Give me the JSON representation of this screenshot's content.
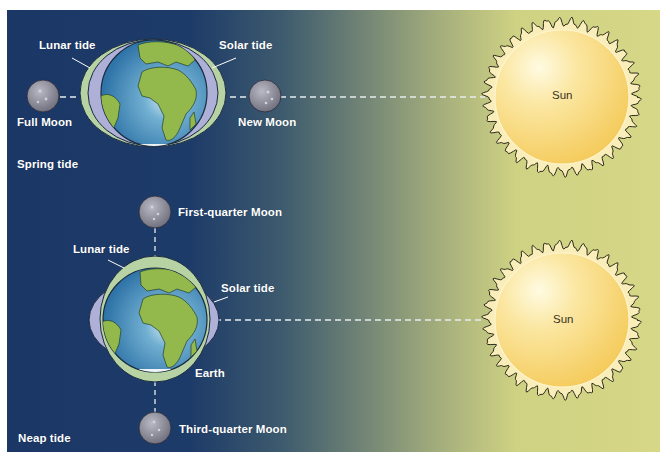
{
  "diagram": {
    "colors": {
      "background_left": "#1b3766",
      "background_right": "#d6d787",
      "lunar_tide_bulge": "#b7d3a3",
      "solar_tide_bulge": "#aeb0d8",
      "ocean": "#3e86b8",
      "land": "#93b84c",
      "moon": "#8d8c99",
      "sun": "#f7d670",
      "label_text": "#ffffff"
    },
    "spring_tide": {
      "section_label": "Spring tide",
      "lunar_tide_label": "Lunar tide",
      "solar_tide_label": "Solar tide",
      "full_moon_label": "Full Moon",
      "new_moon_label": "New Moon",
      "sun_label": "Sun"
    },
    "neap_tide": {
      "section_label": "Neap tide",
      "lunar_tide_label": "Lunar tide",
      "solar_tide_label": "Solar tide",
      "earth_label": "Earth",
      "first_quarter_moon_label": "First-quarter Moon",
      "third_quarter_moon_label": "Third-quarter Moon",
      "sun_label": "Sun"
    }
  }
}
